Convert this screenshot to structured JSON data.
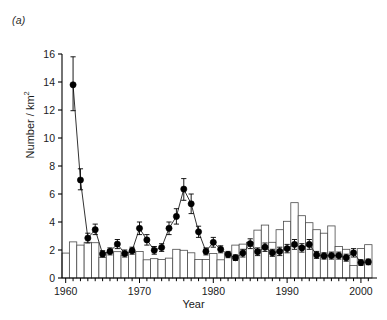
{
  "panel": {
    "label": "(a)"
  },
  "chart_data": {
    "type": "bar",
    "title": "",
    "xlabel": "Year",
    "ylabel": "Number / km2",
    "ylabel_html": "Number / km",
    "ylabel_exponent": "2",
    "xlim": [
      1959.5,
      2001.5
    ],
    "ylim": [
      0,
      16
    ],
    "yticks": [
      0,
      2,
      4,
      6,
      8,
      10,
      12,
      14,
      16
    ],
    "ytick_labels": [
      "0",
      "2",
      "4",
      "6",
      "8",
      "10",
      "12",
      "14",
      "16"
    ],
    "xticks": [
      1960,
      1970,
      1980,
      1990,
      2000
    ],
    "xtick_labels": [
      "1960",
      "1970",
      "1980",
      "1990",
      "2000"
    ],
    "xtick_minor_step": 1,
    "grid": false,
    "legend": null,
    "series": [
      {
        "name": "bars",
        "type": "bar",
        "style": "open-white-black-outline",
        "x": [
          1960,
          1961,
          1962,
          1963,
          1964,
          1965,
          1966,
          1967,
          1968,
          1969,
          1970,
          1971,
          1972,
          1973,
          1974,
          1975,
          1976,
          1977,
          1978,
          1979,
          1980,
          1981,
          1982,
          1983,
          1984,
          1985,
          1986,
          1987,
          1988,
          1989,
          1990,
          1991,
          1992,
          1993,
          1994,
          1995,
          1996,
          1997,
          1998,
          1999,
          2000,
          2001
        ],
        "values": [
          1.78,
          2.58,
          2.35,
          2.55,
          2.52,
          1.48,
          1.82,
          1.88,
          1.62,
          1.82,
          1.9,
          1.3,
          1.38,
          1.32,
          1.42,
          2.05,
          1.98,
          1.8,
          1.32,
          1.32,
          1.75,
          1.3,
          1.78,
          2.35,
          2.42,
          2.55,
          3.42,
          3.78,
          2.55,
          3.45,
          4.05,
          5.38,
          4.45,
          3.95,
          3.45,
          3.2,
          3.72,
          2.25,
          2.05,
          0.9,
          2.1,
          2.38
        ]
      },
      {
        "name": "points",
        "type": "line-marker",
        "style": "filled-circle-with-error-bars",
        "x": [
          1961,
          1962,
          1963,
          1964,
          1965,
          1966,
          1967,
          1968,
          1969,
          1970,
          1971,
          1972,
          1973,
          1974,
          1975,
          1976,
          1977,
          1978,
          1979,
          1980,
          1981,
          1982,
          1983,
          1984,
          1985,
          1986,
          1987,
          1988,
          1989,
          1990,
          1991,
          1992,
          1993,
          1994,
          1995,
          1996,
          1997,
          1998,
          1999,
          2000,
          2001
        ],
        "values": [
          13.8,
          7.0,
          2.85,
          3.45,
          1.72,
          1.9,
          2.42,
          1.75,
          1.95,
          3.55,
          2.72,
          1.98,
          2.18,
          3.55,
          4.4,
          6.35,
          5.3,
          3.3,
          1.9,
          2.55,
          2.05,
          1.68,
          1.45,
          1.78,
          2.45,
          1.88,
          2.2,
          1.8,
          1.9,
          2.1,
          2.4,
          2.15,
          2.4,
          1.65,
          1.58,
          1.6,
          1.6,
          1.45,
          1.8,
          1.1,
          1.15
        ],
        "err_low": [
          11.95,
          6.3,
          2.5,
          3.1,
          1.5,
          1.65,
          2.1,
          1.5,
          1.7,
          3.1,
          2.35,
          1.7,
          1.9,
          3.1,
          3.85,
          5.55,
          4.6,
          2.9,
          1.65,
          2.2,
          1.8,
          1.45,
          1.25,
          1.5,
          2.1,
          1.6,
          1.9,
          1.55,
          1.6,
          1.8,
          2.05,
          1.85,
          2.05,
          1.4,
          1.35,
          1.35,
          1.35,
          1.2,
          1.5,
          0.9,
          0.95
        ],
        "err_high": [
          15.8,
          7.8,
          3.2,
          3.85,
          1.95,
          2.15,
          2.75,
          2.0,
          2.2,
          4.0,
          3.1,
          2.25,
          2.45,
          4.0,
          4.95,
          7.1,
          6.0,
          3.7,
          2.15,
          2.9,
          2.3,
          1.9,
          1.65,
          2.05,
          2.8,
          2.15,
          2.5,
          2.05,
          2.2,
          2.4,
          2.75,
          2.45,
          2.75,
          1.9,
          1.8,
          1.85,
          1.85,
          1.7,
          2.1,
          1.3,
          1.35
        ]
      }
    ]
  },
  "colors": {
    "axis": "#000000",
    "bar_fill": "#ffffff",
    "bar_stroke": "#4a4a4a",
    "marker": "#000000",
    "line": "#333333"
  }
}
